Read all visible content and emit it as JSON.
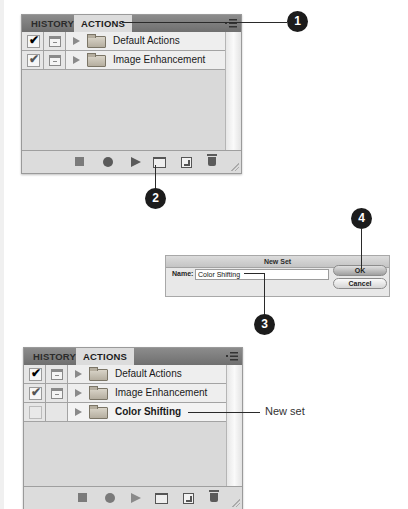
{
  "panel_top": {
    "tabs": [
      {
        "label": "HISTORY",
        "active": false
      },
      {
        "label": "ACTIONS",
        "active": true
      }
    ],
    "sets": [
      {
        "name": "Default Actions",
        "checked": true,
        "dialog_toggle": true
      },
      {
        "name": "Image Enhancement",
        "checked": true,
        "dialog_toggle": true
      }
    ],
    "footer_buttons": [
      "stop-recording",
      "begin-recording",
      "play-selection",
      "create-new-set",
      "create-new-action",
      "delete"
    ]
  },
  "dialog": {
    "title": "New Set",
    "name_label": "Name:",
    "name_value": "Color Shifting",
    "ok_label": "OK",
    "cancel_label": "Cancel"
  },
  "panel_bottom": {
    "tabs": [
      {
        "label": "HISTORY",
        "active": false
      },
      {
        "label": "ACTIONS",
        "active": true
      }
    ],
    "sets": [
      {
        "name": "Default Actions",
        "checked": true,
        "dialog_toggle": true
      },
      {
        "name": "Image Enhancement",
        "checked": true,
        "dialog_toggle": true
      },
      {
        "name": "Color Shifting",
        "checked": false,
        "dialog_toggle": false,
        "selected": true
      }
    ]
  },
  "callouts": [
    "1",
    "2",
    "3",
    "4"
  ],
  "annotation": {
    "new_set": "New set"
  }
}
